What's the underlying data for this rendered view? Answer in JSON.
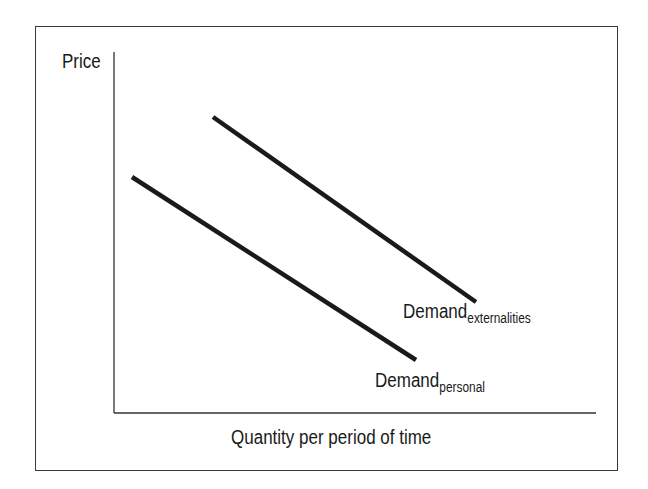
{
  "chart_data": {
    "type": "line",
    "title": "",
    "xlabel": "Quantity per period of time",
    "ylabel": "Price",
    "grid": false,
    "ticks": false,
    "series": [
      {
        "name": "Demand_personal",
        "label_main": "Demand",
        "label_sub": "personal",
        "points": [
          [
            132,
            177
          ],
          [
            416,
            360
          ]
        ],
        "color": "#1a1a1a"
      },
      {
        "name": "Demand_externalities",
        "label_main": "Demand",
        "label_sub": "externalities",
        "points": [
          [
            213,
            117
          ],
          [
            476,
            302
          ]
        ],
        "color": "#1a1a1a"
      }
    ],
    "axes": {
      "origin": [
        114,
        413
      ],
      "y_top": 52,
      "x_right": 596
    }
  },
  "labels": {
    "ylabel": "Price",
    "xlabel": "Quantity per period of time",
    "personal_main": "Demand",
    "personal_sub": "personal",
    "ext_main": "Demand",
    "ext_sub": "externalities"
  }
}
